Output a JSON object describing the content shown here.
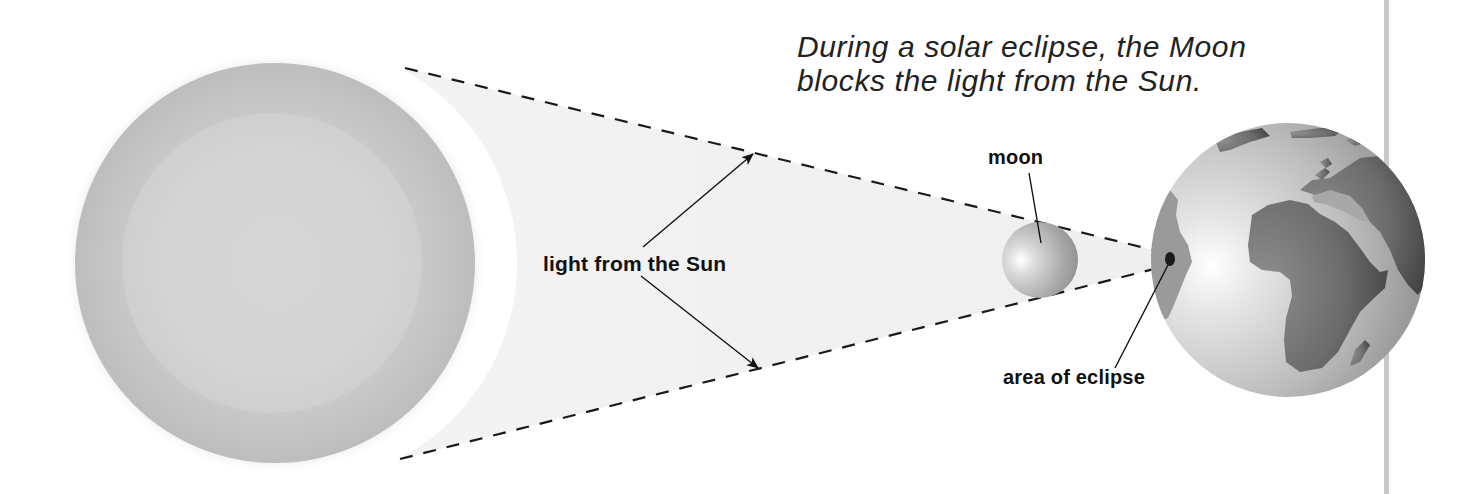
{
  "caption": {
    "line1": "During a solar eclipse, the Moon",
    "line2": "blocks the light from the Sun."
  },
  "labels": {
    "light_from_sun": "light from the Sun",
    "moon": "moon",
    "area_of_eclipse": "area of eclipse"
  },
  "bodies": {
    "sun": {
      "cx": 275,
      "cy": 263,
      "r": 200,
      "color": "#c6c6c6"
    },
    "moon": {
      "cx": 1040,
      "cy": 260,
      "r": 38,
      "color": "#b0b0b0"
    },
    "earth": {
      "cx": 1288,
      "cy": 260,
      "r": 137,
      "color": "#cfcfcf",
      "land_color": "#6a6a6a"
    },
    "eclipse_spot": {
      "cx": 1170,
      "cy": 259,
      "rx": 5,
      "ry": 7,
      "color": "#1a1a1a"
    }
  },
  "colors": {
    "background": "#ffffff",
    "beam": "#f0f0f0",
    "dashes": "#1a1a1a",
    "text": "#111111",
    "side_rule": "#c8c8c8"
  }
}
